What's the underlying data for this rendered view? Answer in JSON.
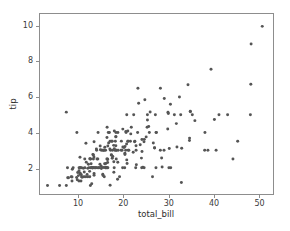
{
  "figure": {
    "background_color": "#ffffff",
    "spine_color": "#8d8d8d",
    "tick_color": "#8d8d8d",
    "tick_label_color": "#3b3b3b",
    "axis_label_color": "#2e2e2e"
  },
  "chart_data": {
    "type": "scatter",
    "title": "",
    "xlabel": "total_bill",
    "ylabel": "tip",
    "xlim": [
      1.4,
      53.2
    ],
    "ylim": [
      0.52,
      10.7
    ],
    "xticks": [
      10,
      20,
      30,
      40,
      50
    ],
    "yticks": [
      2,
      4,
      6,
      8,
      10
    ],
    "xtick_labels": [
      "10",
      "20",
      "30",
      "40",
      "50"
    ],
    "ytick_labels": [
      "2",
      "4",
      "6",
      "8",
      "10"
    ],
    "grid": false,
    "legend": null,
    "marker": {
      "shape": "circle",
      "color": "#555555",
      "size_px": 3.0,
      "alpha": 1.0
    },
    "n_points": 244,
    "series": [
      {
        "name": "tips",
        "x": [
          16.99,
          10.34,
          21.01,
          23.68,
          24.59,
          25.29,
          8.77,
          26.88,
          15.04,
          14.78,
          10.27,
          35.26,
          15.42,
          18.43,
          14.83,
          21.58,
          10.33,
          16.29,
          16.97,
          20.65,
          17.92,
          20.29,
          15.77,
          39.42,
          19.82,
          17.81,
          13.37,
          12.69,
          21.7,
          19.65,
          9.55,
          18.35,
          15.06,
          20.69,
          17.78,
          24.06,
          16.31,
          16.93,
          18.69,
          31.27,
          16.04,
          17.46,
          13.94,
          9.68,
          30.4,
          18.29,
          22.23,
          32.4,
          28.55,
          18.04,
          12.54,
          10.29,
          34.81,
          9.94,
          25.56,
          19.49,
          38.01,
          26.41,
          11.24,
          48.27,
          20.29,
          13.81,
          11.02,
          18.29,
          17.59,
          20.08,
          16.45,
          3.07,
          20.23,
          15.01,
          12.02,
          17.07,
          26.86,
          25.28,
          14.73,
          10.51,
          17.92,
          27.2,
          22.76,
          17.29,
          19.44,
          16.66,
          10.07,
          32.68,
          15.98,
          34.83,
          13.03,
          18.28,
          24.71,
          21.16,
          28.97,
          22.49,
          5.75,
          16.32,
          22.75,
          40.17,
          27.28,
          12.03,
          21.01,
          12.46,
          11.35,
          15.38,
          44.3,
          22.42,
          20.92,
          15.36,
          20.49,
          25.21,
          18.24,
          14.31,
          14.0,
          7.25,
          38.07,
          23.95,
          25.71,
          17.31,
          29.93,
          10.65,
          12.43,
          24.08,
          11.69,
          13.42,
          14.26,
          15.95,
          12.48,
          29.8,
          8.52,
          14.52,
          11.38,
          22.82,
          19.08,
          20.27,
          11.17,
          12.26,
          18.26,
          8.51,
          10.33,
          14.15,
          16.0,
          13.16,
          17.47,
          34.3,
          41.19,
          27.05,
          16.43,
          8.35,
          18.64,
          11.87,
          9.78,
          7.51,
          14.07,
          13.13,
          17.26,
          24.55,
          19.77,
          29.85,
          48.17,
          25.0,
          13.39,
          16.49,
          21.5,
          12.66,
          16.21,
          13.81,
          17.51,
          24.52,
          20.76,
          31.71,
          10.59,
          10.63,
          50.81,
          15.81,
          7.25,
          31.85,
          16.82,
          32.9,
          17.89,
          14.48,
          9.6,
          34.63,
          34.65,
          23.33,
          45.35,
          23.17,
          40.55,
          20.69,
          20.9,
          30.46,
          18.15,
          23.1,
          15.69,
          19.81,
          28.44,
          15.48,
          16.58,
          7.56,
          10.34,
          43.11,
          13.0,
          13.51,
          18.71,
          12.74,
          13.0,
          16.4,
          20.53,
          16.47,
          26.59,
          38.73,
          24.27,
          12.76,
          30.06,
          25.89,
          48.33,
          13.27,
          28.17,
          12.9,
          28.15,
          11.59,
          7.74,
          30.14,
          12.16,
          13.42,
          8.58,
          15.98,
          13.42,
          16.27,
          10.09,
          20.45,
          13.28,
          22.12,
          24.01,
          15.69,
          11.61,
          10.77,
          15.53,
          10.07,
          12.6,
          32.83,
          35.83,
          29.03,
          27.18,
          22.67,
          17.82,
          18.78
        ],
        "y": [
          1.01,
          1.66,
          3.5,
          3.31,
          3.61,
          4.71,
          2.0,
          3.12,
          1.96,
          3.23,
          1.71,
          5.0,
          1.57,
          3.0,
          3.02,
          3.92,
          1.67,
          3.71,
          3.5,
          3.35,
          4.08,
          2.75,
          2.23,
          7.58,
          3.18,
          2.34,
          2.0,
          2.0,
          4.3,
          3.0,
          1.45,
          2.5,
          3.0,
          2.45,
          3.27,
          3.6,
          2.0,
          3.07,
          2.31,
          5.0,
          2.24,
          2.54,
          3.06,
          1.32,
          5.6,
          3.0,
          5.0,
          6.0,
          2.05,
          3.0,
          2.5,
          2.6,
          5.2,
          1.56,
          4.34,
          3.51,
          3.0,
          1.5,
          1.76,
          6.73,
          3.21,
          2.0,
          1.98,
          3.76,
          2.64,
          3.15,
          2.47,
          1.0,
          2.01,
          2.09,
          1.97,
          3.0,
          3.14,
          5.0,
          2.2,
          1.25,
          3.08,
          4.0,
          3.0,
          2.71,
          3.0,
          3.4,
          1.83,
          5.0,
          2.03,
          5.17,
          2.0,
          4.0,
          5.85,
          3.0,
          3.0,
          3.5,
          1.0,
          4.3,
          3.25,
          4.73,
          4.0,
          1.5,
          3.0,
          1.5,
          2.5,
          3.0,
          2.5,
          3.48,
          4.08,
          1.64,
          4.06,
          4.29,
          3.76,
          4.0,
          3.0,
          1.0,
          4.0,
          2.55,
          4.0,
          3.5,
          5.07,
          1.5,
          1.8,
          2.92,
          2.31,
          1.68,
          2.5,
          2.0,
          2.52,
          4.2,
          1.48,
          2.0,
          2.0,
          2.18,
          1.5,
          2.83,
          1.5,
          2.0,
          3.25,
          1.25,
          2.0,
          2.0,
          2.0,
          2.75,
          3.5,
          6.7,
          5.0,
          5.0,
          2.3,
          1.5,
          1.36,
          1.63,
          1.73,
          2.0,
          2.5,
          2.0,
          2.74,
          2.0,
          2.0,
          5.14,
          5.0,
          3.75,
          2.61,
          2.0,
          3.5,
          2.5,
          2.0,
          2.0,
          3.0,
          3.48,
          2.24,
          4.5,
          1.61,
          2.0,
          10.0,
          3.16,
          5.15,
          3.18,
          4.0,
          3.11,
          2.0,
          2.0,
          4.0,
          3.55,
          3.68,
          5.65,
          3.5,
          6.5,
          3.0,
          5.0,
          3.5,
          2.0,
          3.5,
          4.0,
          1.5,
          4.19,
          2.56,
          2.02,
          4.0,
          1.44,
          2.0,
          5.0,
          2.0,
          2.0,
          4.0,
          2.01,
          2.0,
          2.5,
          4.0,
          3.23,
          3.41,
          3.0,
          2.03,
          2.23,
          2.0,
          5.16,
          9.0,
          2.5,
          6.5,
          1.1,
          3.0,
          1.5,
          1.44,
          3.09,
          2.2,
          3.48,
          1.92,
          3.0,
          1.58,
          2.5,
          2.0,
          3.0,
          2.72,
          2.88,
          2.0,
          3.0,
          3.39,
          1.47,
          3.0,
          1.25,
          1.0,
          1.17,
          4.67,
          5.92,
          2.0,
          2.0,
          1.75,
          3.0
        ]
      }
    ]
  }
}
